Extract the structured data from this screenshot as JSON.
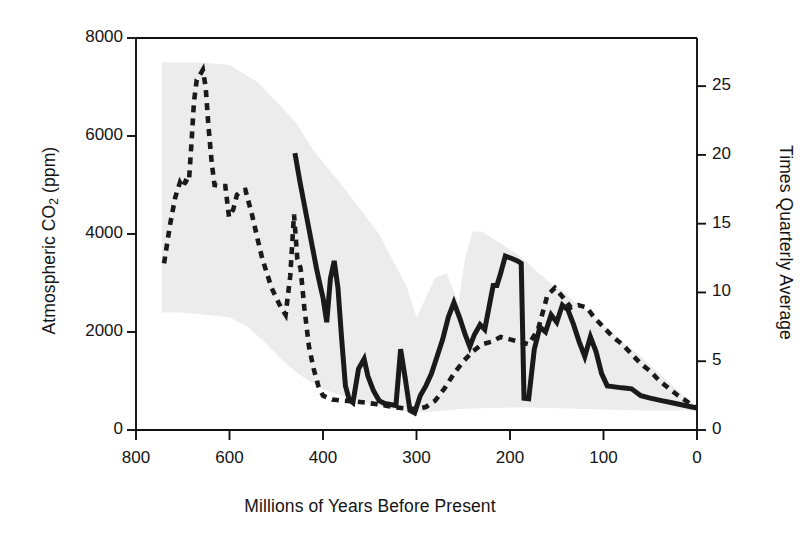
{
  "chart_data": {
    "type": "line",
    "title": "",
    "xlabel": "Millions of Years Before Present",
    "ylabel": "Atmospheric CO2 (ppm)",
    "ylabel_right": "Times Quarterly Average",
    "xlabel_html": "Millions of Years Before Present",
    "grid": false,
    "legend_position": "none",
    "x_axis": {
      "label": "Millions of Years Before Present",
      "ticks": [
        800,
        600,
        400,
        300,
        200,
        100,
        0
      ],
      "tick_labels": [
        "800",
        "600",
        "400",
        "300",
        "200",
        "100",
        "0"
      ],
      "direction": "reversed",
      "note": "tick spacing is uniform in pixels though intervals are 200,200,100,100,100,100"
    },
    "y_axis_left": {
      "label": "Atmospheric CO2 (ppm)",
      "ticks": [
        0,
        2000,
        4000,
        6000,
        8000
      ],
      "tick_labels": [
        "0",
        "2000",
        "4000",
        "6000",
        "8000"
      ],
      "ylim": [
        0,
        8000
      ]
    },
    "y_axis_right": {
      "label": "Times Quarterly Average",
      "ticks": [
        0,
        5,
        10,
        15,
        20,
        25
      ],
      "tick_labels": [
        "0",
        "5",
        "10",
        "15",
        "20",
        "25"
      ],
      "ylim": [
        0,
        28.5
      ]
    },
    "colors": {
      "band_fill": "#ececec",
      "line": "#1a1a1a",
      "axis": "#111111",
      "text": "#141414"
    },
    "series": [
      {
        "name": "GEOCARB model (dashed)",
        "style": "dashed",
        "color": "#1a1a1a",
        "points": [
          [
            740,
            3400
          ],
          [
            727,
            4200
          ],
          [
            716,
            4750
          ],
          [
            706,
            5050
          ],
          [
            700,
            4950
          ],
          [
            694,
            5080
          ],
          [
            687,
            5050
          ],
          [
            681,
            5900
          ],
          [
            676,
            6700
          ],
          [
            670,
            7150
          ],
          [
            663,
            7250
          ],
          [
            657,
            7350
          ],
          [
            651,
            7000
          ],
          [
            645,
            6200
          ],
          [
            638,
            5450
          ],
          [
            632,
            5000
          ],
          [
            620,
            4980
          ],
          [
            609,
            4980
          ],
          [
            601,
            4350
          ],
          [
            592,
            4500
          ],
          [
            584,
            4800
          ],
          [
            575,
            4880
          ],
          [
            566,
            4900
          ],
          [
            552,
            4400
          ],
          [
            540,
            3900
          ],
          [
            530,
            3500
          ],
          [
            520,
            3200
          ],
          [
            510,
            2900
          ],
          [
            500,
            2700
          ],
          [
            490,
            2500
          ],
          [
            480,
            2350
          ],
          [
            470,
            3150
          ],
          [
            462,
            4400
          ],
          [
            455,
            3500
          ],
          [
            448,
            3300
          ],
          [
            440,
            2500
          ],
          [
            430,
            1700
          ],
          [
            420,
            1250
          ],
          [
            410,
            900
          ],
          [
            400,
            700
          ],
          [
            390,
            620
          ],
          [
            380,
            600
          ],
          [
            370,
            590
          ],
          [
            355,
            560
          ],
          [
            340,
            520
          ],
          [
            325,
            470
          ],
          [
            312,
            440
          ],
          [
            300,
            430
          ],
          [
            290,
            470
          ],
          [
            280,
            600
          ],
          [
            270,
            850
          ],
          [
            260,
            1150
          ],
          [
            250,
            1400
          ],
          [
            240,
            1600
          ],
          [
            230,
            1750
          ],
          [
            220,
            1800
          ],
          [
            210,
            1900
          ],
          [
            200,
            1850
          ],
          [
            190,
            1800
          ],
          [
            180,
            1750
          ],
          [
            170,
            2050
          ],
          [
            160,
            2750
          ],
          [
            152,
            2900
          ],
          [
            143,
            2700
          ],
          [
            135,
            2500
          ],
          [
            127,
            2550
          ],
          [
            118,
            2500
          ],
          [
            110,
            2300
          ],
          [
            100,
            2100
          ],
          [
            90,
            1900
          ],
          [
            80,
            1750
          ],
          [
            70,
            1550
          ],
          [
            60,
            1350
          ],
          [
            50,
            1200
          ],
          [
            40,
            1000
          ],
          [
            30,
            850
          ],
          [
            20,
            700
          ],
          [
            12,
            600
          ],
          [
            5,
            500
          ],
          [
            0,
            450
          ]
        ]
      },
      {
        "name": "Proxy reconstruction (solid)",
        "style": "solid",
        "color": "#1a1a1a",
        "points": [
          [
            460,
            5650
          ],
          [
            450,
            5100
          ],
          [
            440,
            4600
          ],
          [
            430,
            4100
          ],
          [
            422,
            3700
          ],
          [
            414,
            3300
          ],
          [
            406,
            2950
          ],
          [
            400,
            2700
          ],
          [
            396,
            2200
          ],
          [
            392,
            3100
          ],
          [
            388,
            3450
          ],
          [
            384,
            2900
          ],
          [
            380,
            1850
          ],
          [
            376,
            900
          ],
          [
            372,
            620
          ],
          [
            368,
            560
          ],
          [
            362,
            1250
          ],
          [
            356,
            1450
          ],
          [
            352,
            1100
          ],
          [
            346,
            800
          ],
          [
            340,
            600
          ],
          [
            334,
            540
          ],
          [
            328,
            520
          ],
          [
            322,
            500
          ],
          [
            317,
            1650
          ],
          [
            312,
            1050
          ],
          [
            307,
            400
          ],
          [
            302,
            350
          ],
          [
            296,
            700
          ],
          [
            290,
            900
          ],
          [
            284,
            1150
          ],
          [
            278,
            1500
          ],
          [
            272,
            1850
          ],
          [
            266,
            2300
          ],
          [
            260,
            2600
          ],
          [
            254,
            2300
          ],
          [
            248,
            1950
          ],
          [
            243,
            1700
          ],
          [
            238,
            1950
          ],
          [
            232,
            2150
          ],
          [
            227,
            2050
          ],
          [
            222,
            2550
          ],
          [
            218,
            2950
          ],
          [
            214,
            2950
          ],
          [
            210,
            3200
          ],
          [
            205,
            3550
          ],
          [
            198,
            3500
          ],
          [
            192,
            3450
          ],
          [
            188,
            3400
          ],
          [
            185,
            650
          ],
          [
            180,
            640
          ],
          [
            174,
            1650
          ],
          [
            168,
            2100
          ],
          [
            162,
            2000
          ],
          [
            156,
            2350
          ],
          [
            150,
            2200
          ],
          [
            144,
            2550
          ],
          [
            138,
            2450
          ],
          [
            132,
            2150
          ],
          [
            126,
            1800
          ],
          [
            120,
            1500
          ],
          [
            114,
            1900
          ],
          [
            108,
            1600
          ],
          [
            102,
            1150
          ],
          [
            96,
            900
          ],
          [
            88,
            880
          ],
          [
            80,
            860
          ],
          [
            70,
            840
          ],
          [
            60,
            700
          ],
          [
            50,
            650
          ],
          [
            38,
            600
          ],
          [
            28,
            560
          ],
          [
            18,
            520
          ],
          [
            8,
            480
          ],
          [
            0,
            450
          ]
        ]
      }
    ],
    "uncertainty_band": {
      "name": "model uncertainty envelope",
      "fill": "#ececec",
      "upper": [
        [
          745,
          7500
        ],
        [
          660,
          7500
        ],
        [
          600,
          7450
        ],
        [
          540,
          7100
        ],
        [
          500,
          6700
        ],
        [
          460,
          6300
        ],
        [
          420,
          5700
        ],
        [
          380,
          5000
        ],
        [
          340,
          4000
        ],
        [
          310,
          2900
        ],
        [
          300,
          2300
        ],
        [
          290,
          2700
        ],
        [
          280,
          3100
        ],
        [
          268,
          3200
        ],
        [
          255,
          2600
        ],
        [
          248,
          3500
        ],
        [
          240,
          4050
        ],
        [
          230,
          4050
        ],
        [
          218,
          3900
        ],
        [
          205,
          3750
        ],
        [
          190,
          3550
        ],
        [
          175,
          3300
        ],
        [
          160,
          3050
        ],
        [
          145,
          2850
        ],
        [
          130,
          2600
        ],
        [
          115,
          2400
        ],
        [
          100,
          2150
        ],
        [
          80,
          1800
        ],
        [
          60,
          1500
        ],
        [
          40,
          1150
        ],
        [
          20,
          800
        ],
        [
          8,
          580
        ],
        [
          0,
          480
        ]
      ],
      "lower": [
        [
          745,
          2400
        ],
        [
          700,
          2400
        ],
        [
          650,
          2350
        ],
        [
          600,
          2300
        ],
        [
          560,
          2100
        ],
        [
          520,
          1750
        ],
        [
          490,
          1450
        ],
        [
          460,
          1200
        ],
        [
          430,
          1000
        ],
        [
          400,
          830
        ],
        [
          370,
          640
        ],
        [
          340,
          480
        ],
        [
          310,
          380
        ],
        [
          290,
          360
        ],
        [
          270,
          400
        ],
        [
          255,
          430
        ],
        [
          240,
          440
        ],
        [
          220,
          450
        ],
        [
          200,
          460
        ],
        [
          180,
          460
        ],
        [
          160,
          450
        ],
        [
          140,
          440
        ],
        [
          120,
          430
        ],
        [
          100,
          420
        ],
        [
          80,
          410
        ],
        [
          60,
          400
        ],
        [
          40,
          400
        ],
        [
          20,
          400
        ],
        [
          8,
          400
        ],
        [
          0,
          400
        ]
      ]
    }
  },
  "axis_labels": {
    "x_title": "Millions of Years Before Present",
    "y_left_prefix": "Atmospheric CO",
    "y_left_sub": "2",
    "y_left_suffix": " (ppm)",
    "y_right_title": "Times Quarterly Average"
  }
}
